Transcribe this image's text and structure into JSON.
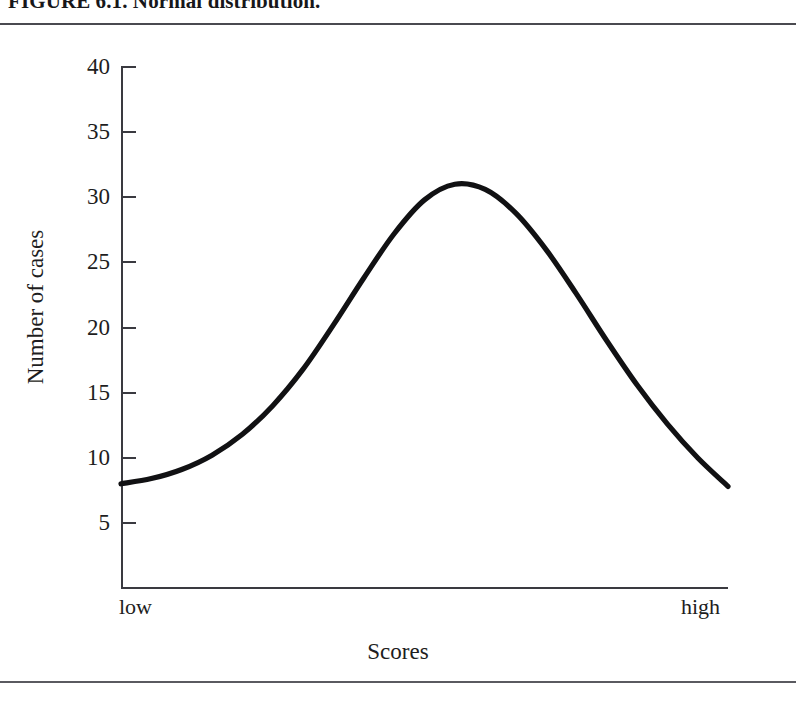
{
  "figure": {
    "caption": "FIGURE 6.1.  Normal distribution.",
    "rules": {
      "top_label": "top-rule",
      "bottom_label": "bottom-rule"
    }
  },
  "axes": {
    "y_title": "Number of cases",
    "x_title": "Scores",
    "x_low_label": "low",
    "x_high_label": "high",
    "y_ticks": [
      "40",
      "35",
      "30",
      "25",
      "20",
      "15",
      "10",
      "5"
    ]
  },
  "chart_data": {
    "type": "line",
    "title": "Normal distribution",
    "xlabel": "Scores",
    "ylabel": "Number of cases",
    "xlim": [
      0,
      100
    ],
    "ylim": [
      0,
      40
    ],
    "x_tick_labels": [
      "low",
      "high"
    ],
    "y_tick_values": [
      5,
      10,
      15,
      20,
      25,
      30,
      35,
      40
    ],
    "grid": false,
    "legend": "none",
    "line_color": "#111113",
    "series": [
      {
        "name": "Normal distribution",
        "x": [
          0,
          5,
          10,
          15,
          20,
          25,
          30,
          35,
          40,
          45,
          50,
          55,
          60,
          65,
          70,
          75,
          80,
          85,
          90,
          95,
          100
        ],
        "y": [
          8.0,
          8.4,
          9.1,
          10.2,
          11.8,
          14.0,
          16.8,
          20.2,
          23.8,
          27.2,
          29.8,
          31.0,
          30.6,
          28.8,
          26.0,
          22.6,
          19.0,
          15.6,
          12.6,
          10.0,
          7.8
        ]
      }
    ]
  }
}
